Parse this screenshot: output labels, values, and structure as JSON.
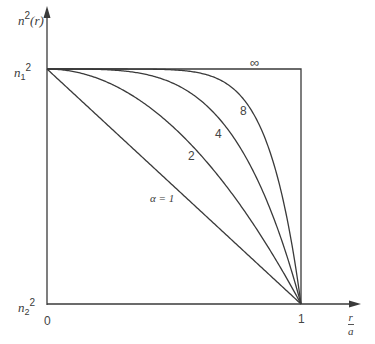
{
  "chart_data": {
    "type": "line",
    "title": "",
    "xlabel": "r/a",
    "ylabel": "n²(r)",
    "xlim": [
      0,
      1
    ],
    "ylim": [
      "n2²",
      "n1²"
    ],
    "x_ticks": [
      "0",
      "1"
    ],
    "y_ticks": [
      "n2²",
      "n1²"
    ],
    "grid": false,
    "legend": "inline curve labels",
    "model": "n²(r) = n1² [1 − 2Δ (r/a)^α] for r ≤ a",
    "series": [
      {
        "name": "α = 1",
        "alpha": 1,
        "label": "α = 1",
        "label_pos": [
          150,
          193
        ]
      },
      {
        "name": "2",
        "alpha": 2,
        "label": "2",
        "label_pos": [
          188,
          150
        ]
      },
      {
        "name": "4",
        "alpha": 4,
        "label": "4",
        "label_pos": [
          215,
          128
        ]
      },
      {
        "name": "8",
        "alpha": 8,
        "label": "8",
        "label_pos": [
          240,
          105
        ]
      },
      {
        "name": "∞",
        "alpha": "infinity",
        "label": "∞",
        "label_pos": [
          250,
          56
        ]
      }
    ]
  },
  "labels": {
    "y_axis_n": "n",
    "y_axis_sup": "2",
    "y_axis_r": "(r)",
    "n1_base": "n",
    "n1_sub": "1",
    "n1_sup": "2",
    "n2_base": "n",
    "n2_sub": "2",
    "n2_sup": "2",
    "origin": "0",
    "x_one": "1",
    "x_num": "r",
    "x_den": "a"
  },
  "colors": {
    "line": "#3a3a3a",
    "background": "#ffffff"
  }
}
